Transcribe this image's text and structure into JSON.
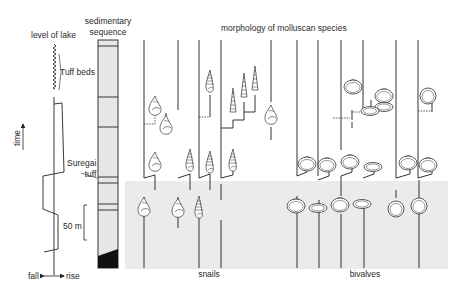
{
  "labels": {
    "lake_level": "level of lake",
    "sedimentary_sequence_line1": "sedimentary",
    "sedimentary_sequence_line2": "sequence",
    "morphology_title": "morphology of molluscan species",
    "tuff_beds": "Tuff beds",
    "suregai_line1": "Suregai",
    "suregai_line2": "tuff",
    "time_axis": "time",
    "scale_bar": "50 m",
    "fall": "fall",
    "rise": "rise",
    "snails": "snails",
    "bivalves": "bivalves"
  },
  "icons": {
    "time_arrow": "arrow-up",
    "fall_rise_arrow": "double-arrow-left-right",
    "snail_shell": "gastropod-shell",
    "turreted_snail": "turreted-gastropod-shell",
    "bivalve_shell": "bivalve-shell"
  },
  "colors": {
    "line": "#222222",
    "shaded_interval": "#ebebeb",
    "column_fill": "#e6e6e6",
    "basal_layer": "#111111"
  },
  "lineages": {
    "top_column_x": [
      144,
      178,
      199,
      221,
      271,
      297,
      318,
      341,
      363,
      396,
      418
    ],
    "bottom_column_x": [
      144,
      199,
      221,
      298,
      319,
      341,
      364,
      419
    ],
    "snail_lineage_count": 4,
    "bivalve_lineage_count": 6
  }
}
